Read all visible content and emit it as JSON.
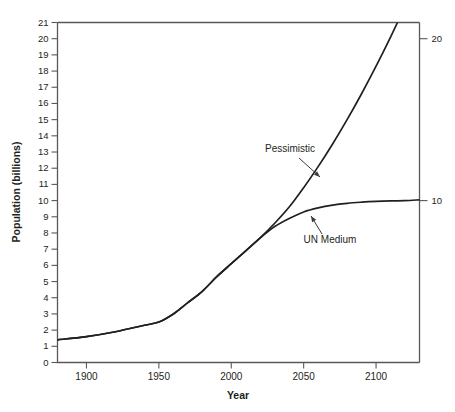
{
  "chart_data": {
    "type": "line",
    "title": "",
    "xlabel": "Year",
    "ylabel": "Population (billions)",
    "xlim": [
      1880,
      2130
    ],
    "ylim": [
      0,
      21
    ],
    "grid": false,
    "legend": "annotations-on-curve",
    "xticks": [
      1900,
      1950,
      2000,
      2050,
      2100
    ],
    "xtick_labels": [
      "1900",
      "1950",
      "2000",
      "2050",
      "2100"
    ],
    "yticks": [
      0,
      1,
      2,
      3,
      4,
      5,
      6,
      7,
      8,
      9,
      10,
      11,
      12,
      13,
      14,
      15,
      16,
      17,
      18,
      19,
      20,
      21
    ],
    "ytick_labels": [
      "0",
      "1",
      "2",
      "3",
      "4",
      "5",
      "6",
      "7",
      "8",
      "9",
      "10",
      "11",
      "12",
      "13",
      "14",
      "15",
      "16",
      "17",
      "18",
      "19",
      "20",
      "21"
    ],
    "right_axis_ticks": [
      10,
      20
    ],
    "right_axis_tick_labels": [
      "10",
      "20"
    ],
    "series": [
      {
        "name": "Pessimistic",
        "label": "Pessimistic",
        "color": "#231f20",
        "x": [
          1880,
          1900,
          1920,
          1940,
          1950,
          1960,
          1970,
          1980,
          1990,
          2000,
          2010,
          2020,
          2030,
          2040,
          2050,
          2060,
          2070,
          2080,
          2090,
          2100,
          2110,
          2120,
          2130
        ],
        "values": [
          1.4,
          1.6,
          1.9,
          2.3,
          2.5,
          3.0,
          3.7,
          4.4,
          5.3,
          6.1,
          6.9,
          7.7,
          8.6,
          9.6,
          10.8,
          12.1,
          13.5,
          15.0,
          16.6,
          18.3,
          20.1,
          22.0,
          24.0
        ]
      },
      {
        "name": "UN Medium",
        "label": "UN Medium",
        "color": "#231f20",
        "x": [
          1880,
          1900,
          1920,
          1940,
          1950,
          1960,
          1970,
          1980,
          1990,
          2000,
          2010,
          2020,
          2030,
          2040,
          2050,
          2060,
          2070,
          2080,
          2090,
          2100,
          2110,
          2120,
          2130
        ],
        "values": [
          1.4,
          1.6,
          1.9,
          2.3,
          2.5,
          3.0,
          3.7,
          4.4,
          5.3,
          6.1,
          6.9,
          7.7,
          8.4,
          8.9,
          9.3,
          9.55,
          9.72,
          9.83,
          9.9,
          9.95,
          9.98,
          10.0,
          10.05
        ]
      }
    ],
    "annotations": [
      {
        "name": "pessimistic-annotation",
        "text": "Pessimistic",
        "label_x": 290,
        "label_y": 152,
        "arrow_from_x": 299,
        "arrow_from_y": 158,
        "arrow_to_x": 320,
        "arrow_to_y": 177
      },
      {
        "name": "un-medium-annotation",
        "text": "UN Medium",
        "label_x": 330,
        "label_y": 243,
        "arrow_from_x": 322,
        "arrow_from_y": 234,
        "arrow_to_x": 311,
        "arrow_to_y": 216
      }
    ]
  },
  "axes": {
    "x_title": "Year",
    "y_title": "Population (billions)"
  },
  "footer": {
    "note": ""
  }
}
